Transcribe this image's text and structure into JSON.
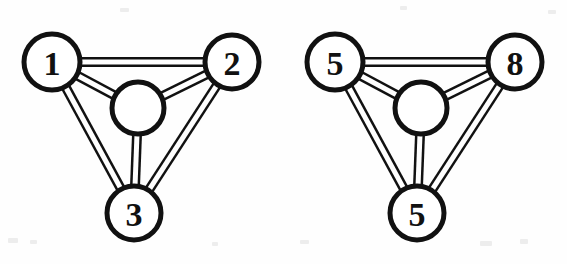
{
  "image": {
    "width": 567,
    "height": 264,
    "background_color": "#fefefe",
    "ink_color": "#111111",
    "description": "Two scanned line-art graph diagrams side by side"
  },
  "diagrams": [
    {
      "id": "left",
      "name": "graph-left",
      "offset_x": 0,
      "nodes": [
        {
          "id": "n1",
          "label": "1",
          "cx": 52,
          "cy": 62,
          "r": 28,
          "role": "labeled-node",
          "position": "top-left"
        },
        {
          "id": "n2",
          "label": "2",
          "cx": 232,
          "cy": 62,
          "r": 27,
          "role": "labeled-node",
          "position": "top-right"
        },
        {
          "id": "n3",
          "label": "3",
          "cx": 134,
          "cy": 213,
          "r": 27,
          "role": "labeled-node",
          "position": "bottom"
        },
        {
          "id": "hub",
          "label": "",
          "cx": 138,
          "cy": 108,
          "r": 26,
          "role": "hub-node",
          "position": "center"
        }
      ],
      "edges": [
        {
          "from": "n1",
          "to": "n2",
          "style": "double-line"
        },
        {
          "from": "n1",
          "to": "n3",
          "style": "double-line"
        },
        {
          "from": "n2",
          "to": "n3",
          "style": "double-line"
        },
        {
          "from": "n1",
          "to": "hub",
          "style": "double-line"
        },
        {
          "from": "n2",
          "to": "hub",
          "style": "double-line"
        },
        {
          "from": "n3",
          "to": "hub",
          "style": "double-line"
        }
      ]
    },
    {
      "id": "right",
      "name": "graph-right",
      "offset_x": 283,
      "nodes": [
        {
          "id": "n1",
          "label": "5",
          "cx": 52,
          "cy": 62,
          "r": 28,
          "role": "labeled-node",
          "position": "top-left"
        },
        {
          "id": "n2",
          "label": "8",
          "cx": 232,
          "cy": 62,
          "r": 27,
          "role": "labeled-node",
          "position": "top-right"
        },
        {
          "id": "n3",
          "label": "5",
          "cx": 134,
          "cy": 213,
          "r": 27,
          "role": "labeled-node",
          "position": "bottom"
        },
        {
          "id": "hub",
          "label": "",
          "cx": 138,
          "cy": 108,
          "r": 26,
          "role": "hub-node",
          "position": "center"
        }
      ],
      "edges": [
        {
          "from": "n1",
          "to": "n2",
          "style": "double-line"
        },
        {
          "from": "n1",
          "to": "n3",
          "style": "double-line"
        },
        {
          "from": "n2",
          "to": "n3",
          "style": "double-line"
        },
        {
          "from": "n1",
          "to": "hub",
          "style": "double-line"
        },
        {
          "from": "n2",
          "to": "hub",
          "style": "double-line"
        },
        {
          "from": "n3",
          "to": "hub",
          "style": "double-line"
        }
      ]
    }
  ],
  "style": {
    "edge_outer_width": 10,
    "edge_inner_width": 5,
    "node_stroke_width": 5,
    "label_font_size": 34
  }
}
